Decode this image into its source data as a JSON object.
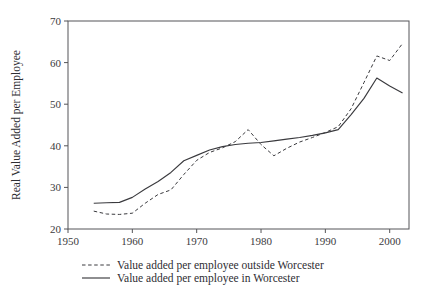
{
  "chart_data": {
    "type": "line",
    "title": "",
    "xlabel": "",
    "ylabel": "Real Value Added per Employee",
    "xlim": [
      1950,
      2003
    ],
    "ylim": [
      20,
      70
    ],
    "xticks": [
      1950,
      1960,
      1970,
      1980,
      1990,
      2000
    ],
    "xtick_labels": [
      "1950",
      "1960",
      "1970",
      "1980",
      "1990",
      "2000"
    ],
    "yticks": [
      20,
      30,
      40,
      50,
      60,
      70
    ],
    "ytick_labels": [
      "20",
      "30",
      "40",
      "50",
      "60",
      "70"
    ],
    "grid": false,
    "legend_position": "below",
    "series": [
      {
        "name": "Value added per employee outside Worcester",
        "style": "dashed",
        "color": "#3a3a3e",
        "x": [
          1954,
          1956,
          1958,
          1960,
          1962,
          1964,
          1966,
          1968,
          1970,
          1972,
          1974,
          1976,
          1978,
          1980,
          1982,
          1984,
          1986,
          1988,
          1990,
          1992,
          1994,
          1996,
          1998,
          2000,
          2002
        ],
        "y": [
          24.3,
          23.6,
          23.5,
          23.8,
          26.2,
          28.3,
          29.4,
          33.1,
          36.5,
          38.4,
          39.5,
          41.0,
          43.9,
          40.3,
          37.6,
          39.4,
          40.9,
          42.0,
          43.2,
          44.6,
          48.9,
          55.2,
          61.6,
          60.5,
          64.6
        ]
      },
      {
        "name": "Value added per employee in Worcester",
        "style": "solid",
        "color": "#3a3a3e",
        "x": [
          1954,
          1956,
          1958,
          1960,
          1962,
          1964,
          1966,
          1968,
          1970,
          1972,
          1974,
          1976,
          1978,
          1980,
          1982,
          1984,
          1986,
          1988,
          1990,
          1992,
          1994,
          1996,
          1998,
          2000,
          2002
        ],
        "y": [
          26.2,
          26.3,
          26.4,
          27.6,
          29.6,
          31.4,
          33.6,
          36.4,
          37.7,
          39.0,
          39.8,
          40.3,
          40.6,
          40.8,
          41.2,
          41.6,
          42.0,
          42.5,
          43.1,
          43.9,
          47.5,
          51.4,
          56.3,
          54.4,
          52.7
        ]
      }
    ]
  },
  "legend": {
    "items": [
      {
        "label": "Value added per employee outside Worcester",
        "style": "dashed"
      },
      {
        "label": "Value added per employee in Worcester",
        "style": "solid"
      }
    ]
  }
}
